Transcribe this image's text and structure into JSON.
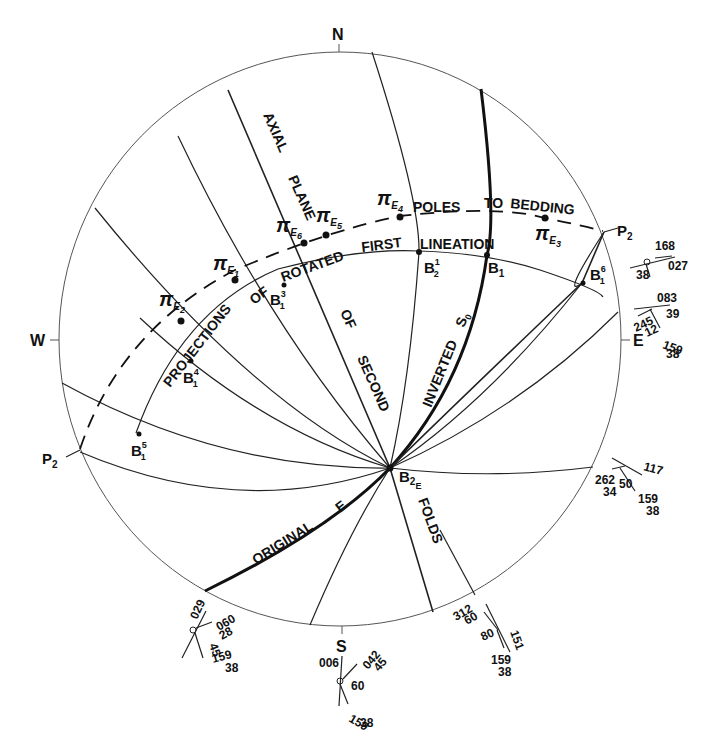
{
  "diagram": {
    "type": "stereonet-equal-area",
    "primitive_circle": {
      "cx": 340,
      "cy": 339,
      "r": 284
    },
    "compass": {
      "north": "N",
      "south": "S",
      "east": "E",
      "west": "W"
    },
    "curve_labels": {
      "axial": "AXIAL",
      "plane": "PLANE",
      "of": "OF",
      "second": "SECOND",
      "folds": "FOLDS",
      "inverted": "INVERTED",
      "s0": "S",
      "s0_sub": "0",
      "original": "ORIGINAL",
      "e": "E",
      "poles": "POLES",
      "to": "TO",
      "bedding": "BEDDING",
      "projections": "PROJECTIONS",
      "of2": "OF",
      "rotated": "ROTATED",
      "first": "FIRST",
      "lineation": "LINEATION"
    },
    "points": {
      "pi_e1": {
        "symbol": "π",
        "sub": "E",
        "subsub": "1"
      },
      "pi_e2": {
        "symbol": "π",
        "sub": "E",
        "subsub": "2"
      },
      "pi_e3": {
        "symbol": "π",
        "sub": "E",
        "subsub": "3"
      },
      "pi_e4": {
        "symbol": "π",
        "sub": "E",
        "subsub": "4"
      },
      "pi_e5": {
        "symbol": "π",
        "sub": "E",
        "subsub": "5"
      },
      "pi_e6": {
        "symbol": "π",
        "sub": "E",
        "subsub": "6"
      },
      "b1": {
        "base": "B",
        "sub": "1",
        "sup": ""
      },
      "b2_1": {
        "base": "B",
        "sub": "2",
        "sup": "1"
      },
      "b1_3": {
        "base": "B",
        "sub": "1",
        "sup": "3"
      },
      "b1_4": {
        "base": "B",
        "sub": "1",
        "sup": "4"
      },
      "b1_5": {
        "base": "B",
        "sub": "1",
        "sup": "5"
      },
      "b1_6": {
        "base": "B",
        "sub": "1",
        "sup": "6"
      },
      "b2e": {
        "base": "B",
        "sub": "2",
        "subsub": "E"
      },
      "p2_left": {
        "base": "P",
        "sub": "2"
      },
      "p2_right": {
        "base": "P",
        "sub": "2"
      }
    },
    "field_symbols": {
      "ene": {
        "a": "168",
        "b": "38",
        "c": "027"
      },
      "east": {
        "a": "083",
        "b": "39",
        "c": "245",
        "d": "12",
        "e": "159",
        "f": "38"
      },
      "ese": {
        "a": "117",
        "b": "262",
        "c": "34",
        "d": "50",
        "e": "159",
        "f": "38"
      },
      "sse": {
        "a": "312",
        "b": "60",
        "c": "80",
        "d": "151",
        "e": "159",
        "f": "38"
      },
      "south": {
        "a": "006",
        "b": "042",
        "c": "45",
        "d": "60",
        "e": "159",
        "f": "38"
      },
      "ssw": {
        "a": "029",
        "b": "060",
        "c": "28",
        "d": "45",
        "e": "159",
        "f": "38"
      }
    }
  }
}
